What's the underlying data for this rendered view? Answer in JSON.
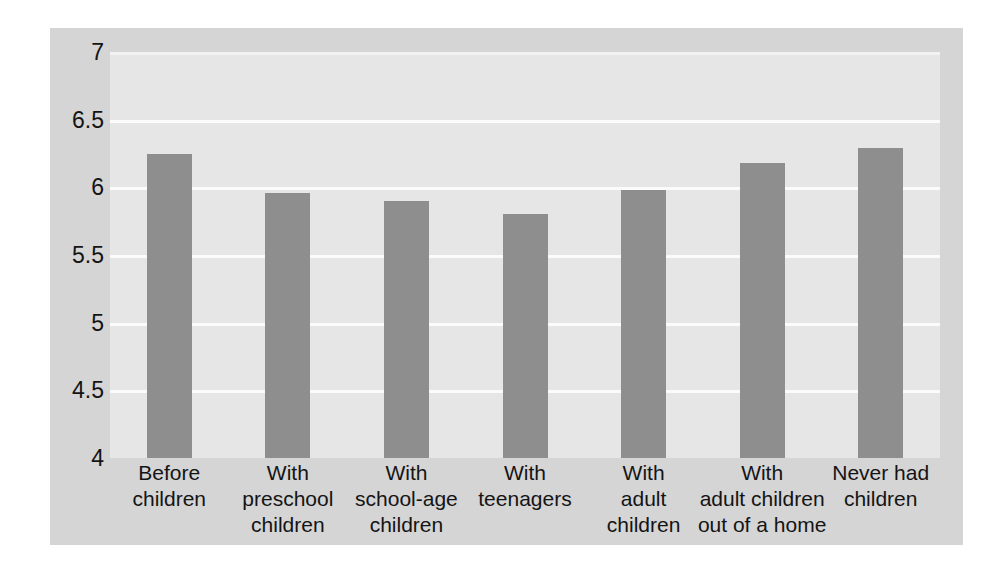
{
  "chart_data": {
    "type": "bar",
    "title": "",
    "subtitle": "",
    "xlabel": "",
    "ylabel": "",
    "ylim": [
      4,
      7
    ],
    "yticks": [
      "7",
      "6.5",
      "6",
      "5.5",
      "5",
      "4.5",
      "4"
    ],
    "ytick_values": [
      7,
      6.5,
      6,
      5.5,
      5,
      4.5,
      4
    ],
    "grid": "horizontal",
    "legend": "none",
    "bar_color": "#8e8e8e",
    "plot_background": "#e6e6e6",
    "panel_background": "#d5d5d5",
    "gridline_color": "#fbfbfb",
    "categories": [
      "Before\nchildren",
      "With\npreschool\nchildren",
      "With\nschool-age\nchildren",
      "With\nteenagers",
      "With\nadult\nchildren",
      "With\nadult children\nout of a home",
      "Never had\nchildren"
    ],
    "values": [
      6.25,
      5.96,
      5.9,
      5.8,
      5.98,
      6.18,
      6.29
    ]
  }
}
